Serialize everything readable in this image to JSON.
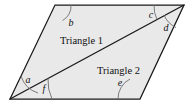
{
  "figure": {
    "background_color": "#ffffff",
    "fill_color": "#e9e9e9",
    "outline_color": "#1a1a1a",
    "arc_color": "#6e6e6e",
    "label_color": "#111111",
    "vertices": {
      "bottom_left": [
        10,
        99
      ],
      "top_left": [
        55,
        5
      ],
      "top_right": [
        184,
        5
      ],
      "bottom_right": [
        140,
        99
      ]
    },
    "diagonal": {
      "from": [
        10,
        99
      ],
      "to": [
        184,
        5
      ]
    },
    "regions": [
      {
        "id": "triangle-1",
        "label": "Triangle 1",
        "x": 60,
        "y": 44
      },
      {
        "id": "triangle-2",
        "label": "Triangle 2",
        "x": 97,
        "y": 74
      }
    ],
    "angles": [
      {
        "id": "a",
        "label": "a",
        "x": 28,
        "y": 83,
        "vertex": "bottom_left",
        "between": "left-side and diagonal"
      },
      {
        "id": "b",
        "label": "b",
        "x": 71,
        "y": 26,
        "vertex": "top_left",
        "between": "left-side and top-side"
      },
      {
        "id": "c",
        "label": "c",
        "x": 151,
        "y": 18,
        "vertex": "top_right",
        "between": "top-side and diagonal"
      },
      {
        "id": "d",
        "label": "d",
        "x": 166,
        "y": 31,
        "vertex": "top_right",
        "between": "diagonal and right-side"
      },
      {
        "id": "e",
        "label": "e",
        "x": 120,
        "y": 86,
        "vertex": "bottom_right",
        "between": "bottom-side and right-side"
      },
      {
        "id": "f",
        "label": "f",
        "x": 44,
        "y": 92,
        "vertex": "bottom_left",
        "between": "diagonal and bottom-side"
      }
    ]
  }
}
